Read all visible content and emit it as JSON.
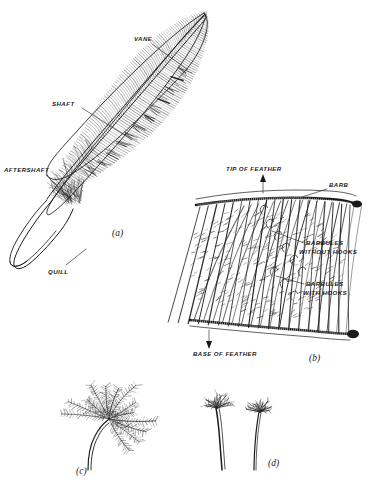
{
  "plate": {
    "title": "Structure of Feathers",
    "background_color": "#ffffff",
    "ink_color": "#1a1a1a",
    "width": 370,
    "height": 487
  },
  "panels": [
    {
      "id": "a",
      "label": "(a)",
      "label_x": 112,
      "label_y": 236,
      "subject": "whole contour feather",
      "description": "Complete pennaceous contour feather drawn on a diagonal, tip at upper right, quill at lower left."
    },
    {
      "id": "b",
      "label": "(b)",
      "label_x": 309,
      "label_y": 361,
      "subject": "enlarged barb and barbule lattice",
      "description": "Two barbs with interlocking barbules forming the vane mesh."
    },
    {
      "id": "c",
      "label": "(c)",
      "label_x": 76,
      "label_y": 474,
      "subject": "down feather",
      "description": "Plumulaceous down feather with soft radiating barbs and no firm vane."
    },
    {
      "id": "d",
      "label": "(d)",
      "label_x": 268,
      "label_y": 466,
      "subject": "filoplumes",
      "description": "Two hair-like filoplumes, bare shafts with small tufts of barbs at the tips."
    }
  ],
  "annotations": {
    "vane": {
      "text": "VANE",
      "text_x": 134,
      "text_y": 41,
      "leader": [
        [
          152,
          44
        ],
        [
          188,
          70
        ]
      ]
    },
    "shaft": {
      "text": "SHAFT",
      "text_x": 52,
      "text_y": 106,
      "leader": [
        [
          82,
          108
        ],
        [
          132,
          140
        ]
      ]
    },
    "aftershaft": {
      "text": "AFTERSHAFT",
      "text_x": 5,
      "text_y": 172,
      "leader": [
        [
          46,
          175
        ],
        [
          72,
          201
        ]
      ]
    },
    "quill": {
      "text": "QUILL",
      "text_x": 48,
      "text_y": 272,
      "leader": [
        [
          66,
          265
        ],
        [
          86,
          249
        ]
      ]
    },
    "tip_of_feather": {
      "text": "TIP OF FEATHER",
      "text_x": 227,
      "text_y": 171,
      "arrow": {
        "x": 263,
        "y1": 193,
        "y2": 176,
        "direction": "up"
      }
    },
    "base_of_feather": {
      "text": "BASE OF FEATHER",
      "text_x": 194,
      "text_y": 355,
      "arrow": {
        "x": 209,
        "y1": 330,
        "y2": 347,
        "direction": "down"
      }
    },
    "barb": {
      "text": "BARB",
      "text_x": 329,
      "text_y": 186,
      "leader": [
        [
          327,
          189
        ],
        [
          302,
          197
        ]
      ]
    },
    "barbules_without_hooks": {
      "text_line1": "BARBULES",
      "text_line2": "WITHOUT HOOKS",
      "text_x": 306,
      "text_y1": 244,
      "text_y2": 253,
      "leader": [
        [
          304,
          247
        ],
        [
          272,
          231
        ]
      ]
    },
    "barbules_with_hooks": {
      "text_line1": "BARBULES",
      "text_line2": "WITH HOOKS",
      "text_x": 306,
      "text_y1": 285,
      "text_y2": 294,
      "leader": [
        [
          304,
          287
        ],
        [
          276,
          277
        ]
      ]
    }
  }
}
